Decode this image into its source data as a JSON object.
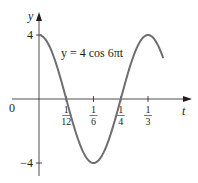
{
  "chart_data": {
    "type": "line",
    "title": "",
    "equation": "y = 4 cos 6πt",
    "xlabel": "t",
    "ylabel": "y",
    "origin_label": "0",
    "x_ticks": [
      {
        "num": "1",
        "den": "12",
        "value": 0.08333
      },
      {
        "num": "1",
        "den": "6",
        "value": 0.16667
      },
      {
        "num": "1",
        "den": "4",
        "value": 0.25
      },
      {
        "num": "1",
        "den": "3",
        "value": 0.33333
      }
    ],
    "y_ticks": [
      {
        "label": "4",
        "value": 4
      },
      {
        "label": "−4",
        "value": -4
      }
    ],
    "xlim": [
      0,
      0.38
    ],
    "ylim": [
      -4,
      4
    ],
    "grid": false,
    "series": [
      {
        "name": "y = 4 cos 6πt",
        "function": "4*cos(6*pi*t)",
        "x": [
          0,
          0.04167,
          0.08333,
          0.125,
          0.16667,
          0.20833,
          0.25,
          0.29167,
          0.33333,
          0.38
        ],
        "values": [
          4,
          2.83,
          0,
          -2.83,
          -4,
          -2.83,
          0,
          2.83,
          4,
          2.43
        ]
      }
    ],
    "colors": {
      "curve": "#6d6e71",
      "axes": "#231f20"
    }
  }
}
